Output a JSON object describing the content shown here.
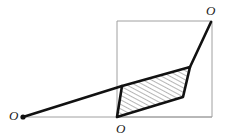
{
  "figure": {
    "type": "geometry-diagram",
    "canvas": {
      "width": 226,
      "height": 140,
      "background": "#ffffff"
    },
    "colors": {
      "heavy_stroke": "#111111",
      "light_stroke": "#a0a0a0",
      "hatch_stroke": "#2b2b2b",
      "label_text": "#1a1a1a",
      "fill": "#ffffff"
    },
    "strokes": {
      "heavy_width": 2.6,
      "light_width": 1.0,
      "hatch_width": 0.7,
      "hatch_spacing": 4.0,
      "hatch_angle_deg": 62
    },
    "labels": [
      {
        "id": "origin-left",
        "text": "O",
        "x": 9,
        "y": 109
      },
      {
        "id": "origin-bottom",
        "text": "O",
        "x": 116,
        "y": 122
      },
      {
        "id": "origin-top",
        "text": "O",
        "x": 206,
        "y": 4
      }
    ],
    "points": {
      "left_origin": {
        "x": 23,
        "y": 117
      },
      "bottom_origin": {
        "x": 117,
        "y": 117
      },
      "top_origin": {
        "x": 211,
        "y": 22
      },
      "para_top_left": {
        "x": 122,
        "y": 86
      },
      "para_top_right": {
        "x": 190,
        "y": 67
      },
      "para_bottom_right": {
        "x": 183,
        "y": 97
      },
      "rect_top_left": {
        "x": 117,
        "y": 21
      },
      "rect_top_right": {
        "x": 212,
        "y": 21
      },
      "rect_bottom_right": {
        "x": 212,
        "y": 117
      },
      "rect_bottom_left": {
        "x": 117,
        "y": 117
      }
    },
    "shapes": {
      "frame_rect": {
        "name": "light-rectangle-frame",
        "points": "117,21 212,21 212,117 117,117"
      },
      "baseline": {
        "name": "horizontal-baseline",
        "x1": 23,
        "y1": 117,
        "x2": 212,
        "y2": 117
      },
      "parallelogram": {
        "name": "hatched-parallelogram",
        "points": "117,117 122,86 190,67 183,97"
      },
      "upper_ray": {
        "name": "upper-heavy-ray",
        "x1": 23,
        "y1": 117,
        "x2": 122,
        "y2": 86
      },
      "right_ray": {
        "name": "right-heavy-ray",
        "x1": 190,
        "y1": 67,
        "x2": 211,
        "y2": 22
      },
      "origin_dot": {
        "name": "left-origin-dot",
        "cx": 23,
        "cy": 117,
        "r": 2.6
      }
    }
  }
}
